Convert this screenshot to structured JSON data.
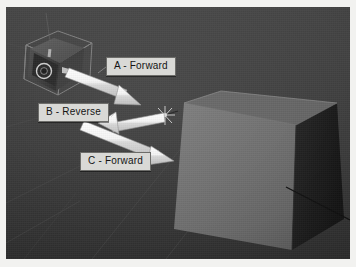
{
  "figure": {
    "kind": "3d-render-diagram",
    "background_color": "#3a3a3a",
    "paper_color": "#f2f2f0",
    "annotations": [
      {
        "id": "a",
        "label": "A - Forward",
        "direction": "forward",
        "arrow": "down-right"
      },
      {
        "id": "b",
        "label": "B - Reverse",
        "direction": "reverse",
        "arrow": "up-left"
      },
      {
        "id": "c",
        "label": "C - Forward",
        "direction": "forward",
        "arrow": "down-right"
      }
    ],
    "objects": [
      {
        "name": "camera",
        "position": "upper-left",
        "color": "#565656",
        "selected": true
      },
      {
        "name": "cube",
        "position": "right",
        "front_face_color": "#6e6e6e",
        "side_face_color": "#1d1d1d"
      },
      {
        "name": "hit-marker",
        "position": "center",
        "color": "#c8c8c8"
      }
    ],
    "arrow_color": "#ededed",
    "label_background": "#d9d9d6",
    "label_text_color": "#141414"
  }
}
